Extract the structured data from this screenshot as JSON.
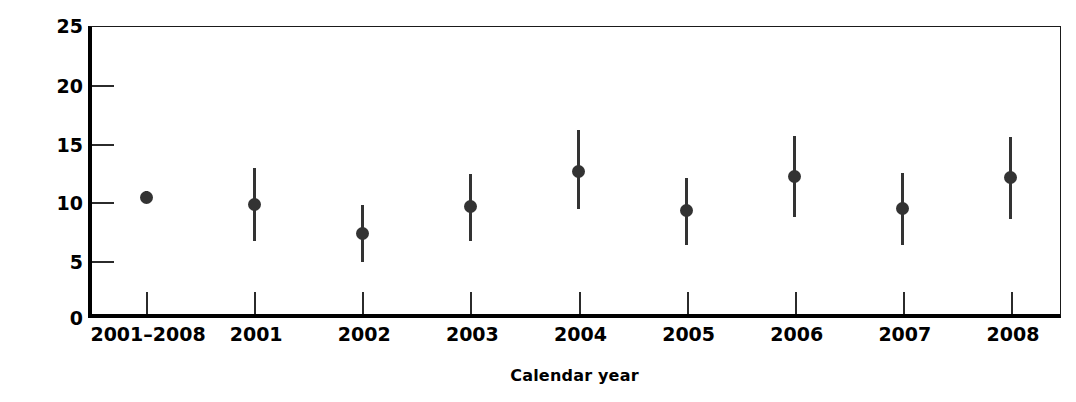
{
  "chart_data": {
    "type": "scatter",
    "title": "",
    "xlabel": "Calendar year",
    "ylabel": "Rate per 100,000",
    "categories": [
      "2001–2008",
      "2001",
      "2002",
      "2003",
      "2004",
      "2005",
      "2006",
      "2007",
      "2008"
    ],
    "values": [
      10.4,
      9.8,
      7.3,
      9.6,
      12.6,
      9.3,
      12.2,
      9.5,
      12.1
    ],
    "error_low": [
      9.9,
      6.7,
      4.9,
      6.7,
      9.4,
      6.3,
      8.7,
      6.3,
      8.6
    ],
    "error_high": [
      11.0,
      12.9,
      9.8,
      12.4,
      16.2,
      12.1,
      15.7,
      12.5,
      15.6
    ],
    "series": [
      {
        "name": "Rate per 100,000",
        "values": [
          10.4,
          9.8,
          7.3,
          9.6,
          12.6,
          9.3,
          12.2,
          9.5,
          12.1
        ]
      }
    ],
    "points": [
      {
        "category": "2001–2008",
        "value": 10.4,
        "low": 9.9,
        "high": 11.0
      },
      {
        "category": "2001",
        "value": 9.8,
        "low": 6.7,
        "high": 12.9
      },
      {
        "category": "2002",
        "value": 7.3,
        "low": 4.9,
        "high": 9.8
      },
      {
        "category": "2003",
        "value": 9.6,
        "low": 6.7,
        "high": 12.4
      },
      {
        "category": "2004",
        "value": 12.6,
        "low": 9.4,
        "high": 16.2
      },
      {
        "category": "2005",
        "value": 9.3,
        "low": 6.3,
        "high": 12.1
      },
      {
        "category": "2006",
        "value": 12.2,
        "low": 8.7,
        "high": 15.7
      },
      {
        "category": "2007",
        "value": 9.5,
        "low": 6.3,
        "high": 12.5
      },
      {
        "category": "2008",
        "value": 12.1,
        "low": 8.6,
        "high": 15.6
      }
    ],
    "ylim": [
      0,
      25
    ],
    "yticks": [
      0,
      5,
      10,
      15,
      20,
      25
    ],
    "ytick_labels": [
      "0",
      "5",
      "10",
      "15",
      "20",
      "25"
    ],
    "xtick_labels": [
      "2001–2008",
      "2001",
      "2002",
      "2003",
      "2004",
      "2005",
      "2006",
      "2007",
      "2008"
    ],
    "grid": false,
    "legend": false,
    "marker_color": "#333333",
    "axis_color": "#000000",
    "background_color": "#ffffff"
  }
}
